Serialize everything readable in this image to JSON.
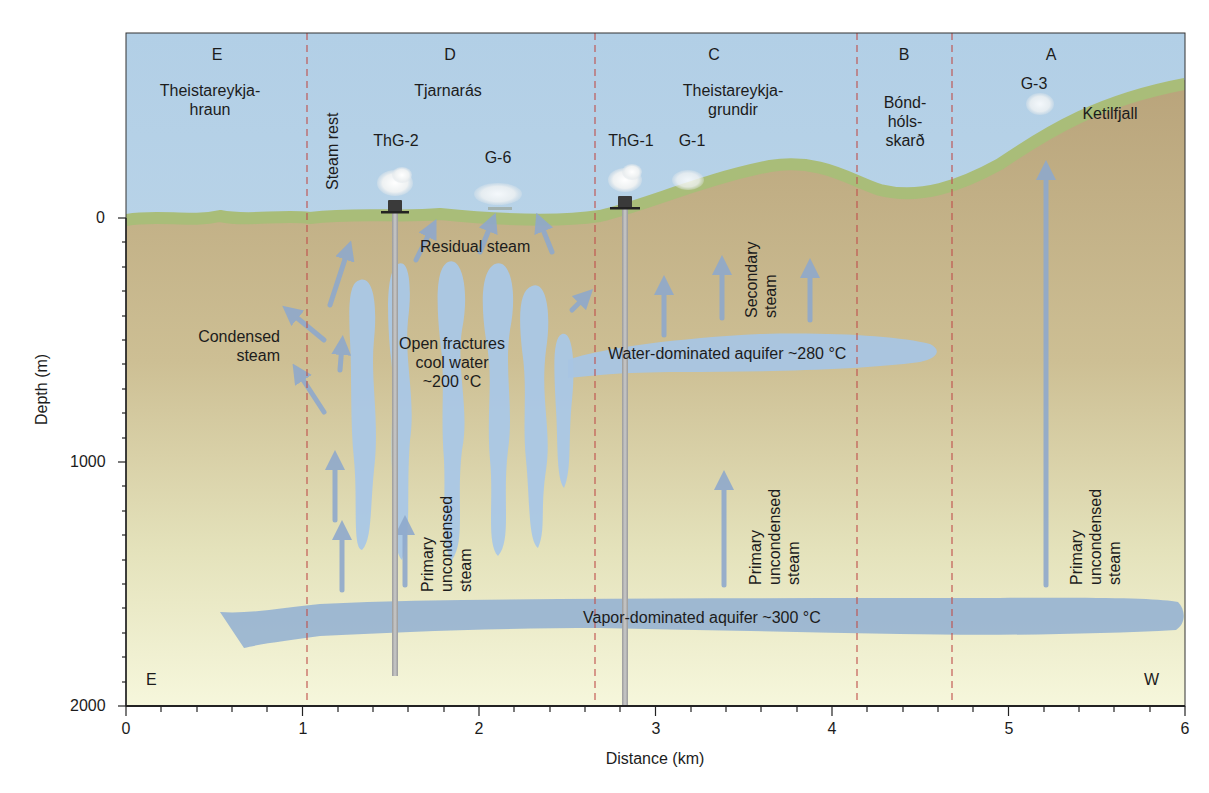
{
  "diagram": {
    "type": "geothermal cross-section",
    "axes": {
      "x_label": "Distance (km)",
      "y_label": "Depth (m)",
      "x_ticks": [
        "0",
        "1",
        "2",
        "3",
        "4",
        "5",
        "6"
      ],
      "y_ticks": [
        "0",
        "1000",
        "2000"
      ],
      "x_range": [
        0,
        6
      ],
      "y_range": [
        0,
        2000
      ]
    },
    "zones": [
      {
        "letter": "E",
        "name": "Theistareykja-\nhraun",
        "name_line1": "Theistareykja-",
        "name_line2": "hraun"
      },
      {
        "letter": "D",
        "name": "Tjarnarás"
      },
      {
        "letter": "C",
        "name_line1": "Theistareykja-",
        "name_line2": "grundir"
      },
      {
        "letter": "B",
        "name_line1": "Bónd-",
        "name_line2": "hóls-",
        "name_line3": "skarð"
      },
      {
        "letter": "A",
        "name": "Ketilfjall"
      }
    ],
    "zone_boundaries_km": [
      1.03,
      2.66,
      4.15,
      4.69
    ],
    "features": {
      "steam_rest": "Steam rest",
      "wells": [
        {
          "name": "ThG-2",
          "x_km": 1.52,
          "bottom_m": 1760
        },
        {
          "name": "ThG-1",
          "x_km": 2.83,
          "bottom_m": 2000
        }
      ],
      "fumaroles": [
        {
          "name": "G-6",
          "x_km": 2.1
        },
        {
          "name": "G-1",
          "x_km": 3.15
        },
        {
          "name": "G-3",
          "x_km": 5.2
        }
      ],
      "residual_steam": "Residual steam",
      "condensed_steam_line1": "Condensed",
      "condensed_steam_line2": "steam",
      "open_fractures_line1": "Open fractures",
      "open_fractures_line2": "cool water",
      "open_fractures_line3": "~200 °C",
      "secondary_steam_line1": "Secondary",
      "secondary_steam_line2": "steam",
      "water_aquifer": "Water-dominated aquifer ~280 °C",
      "vapor_aquifer": "Vapor-dominated aquifer ~300 °C",
      "primary_steam_line1": "Primary",
      "primary_steam_line2": "uncondensed",
      "primary_steam_line3": "steam"
    },
    "compass": {
      "left": "E",
      "right": "W"
    },
    "colors": {
      "sky": "#b7d2e6",
      "grass": "#a8bc78",
      "soil_top": "#bba67c",
      "soil_bottom": "#f4f5d8",
      "water": "#a9c6e2",
      "vapor_aquifer": "#97b4d2",
      "arrow": "#8fa9cc",
      "boundary": "#c0504d",
      "well": "#a7a7a7"
    }
  }
}
